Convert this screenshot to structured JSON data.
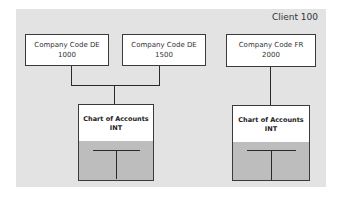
{
  "client": {
    "label": "Client 100"
  },
  "company_codes": [
    {
      "line1": "Company Code DE",
      "line2": "1000"
    },
    {
      "line1": "Company Code DE",
      "line2": "1500"
    },
    {
      "line1": "Company Code FR",
      "line2": "2000"
    }
  ],
  "charts_of_accounts": [
    {
      "line1": "Chart of Accounts",
      "line2": "INT"
    },
    {
      "line1": "Chart of Accounts",
      "line2": "INT"
    }
  ],
  "colors": {
    "panel_background": "#e3e3e3",
    "box_background": "#ffffff",
    "ledger_background": "#bdbdbd",
    "line_color": "#2a2a2a"
  }
}
